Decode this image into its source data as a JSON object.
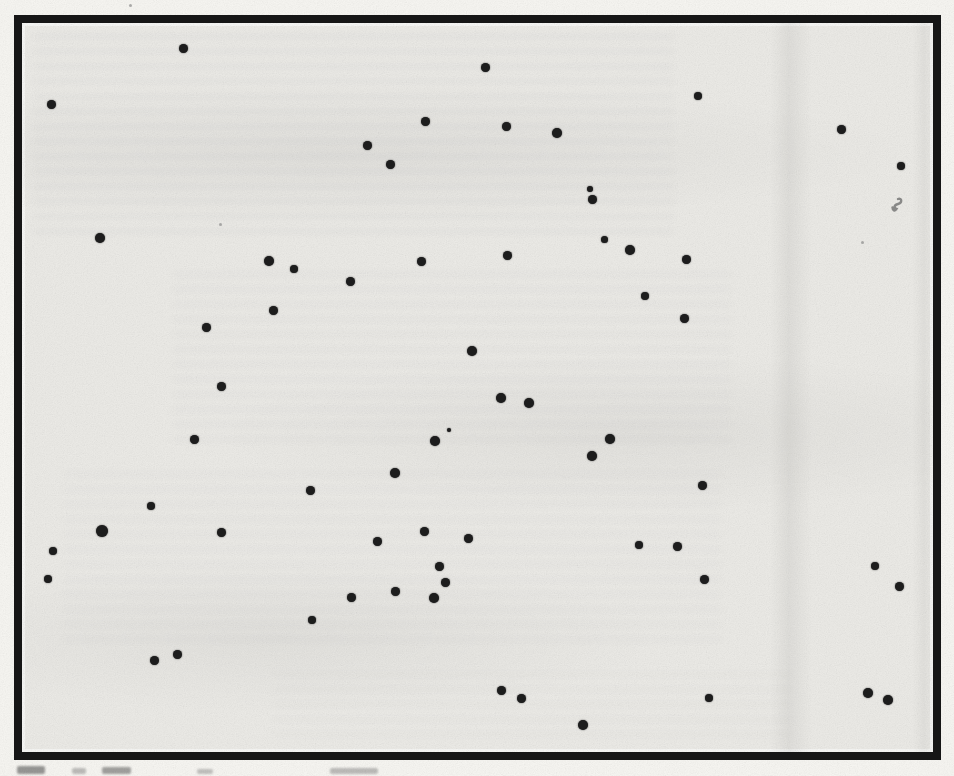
{
  "figure": {
    "colors": {
      "page": "#f7f6f2",
      "field": "#ecebe7",
      "frame": "#161616",
      "dot": "#1d1d1d",
      "speck": "#9a9a98",
      "smudge": "#6b6b6b"
    },
    "frame": {
      "left": 14,
      "top": 15,
      "width": 927,
      "height": 745,
      "border_px": 8
    },
    "dot_count": 65,
    "dots": [
      [
        183,
        48,
        9
      ],
      [
        51,
        104,
        9
      ],
      [
        100,
        238,
        10
      ],
      [
        485,
        67,
        9
      ],
      [
        425,
        121,
        9
      ],
      [
        506,
        126,
        9
      ],
      [
        557,
        133,
        10
      ],
      [
        367,
        145,
        9
      ],
      [
        390,
        164,
        9
      ],
      [
        590,
        189,
        6
      ],
      [
        592,
        199,
        9
      ],
      [
        604,
        239,
        7
      ],
      [
        630,
        250,
        10
      ],
      [
        507,
        255,
        9
      ],
      [
        698,
        96,
        8
      ],
      [
        841,
        129,
        9
      ],
      [
        901,
        166,
        8
      ],
      [
        686,
        259,
        9
      ],
      [
        269,
        261,
        10
      ],
      [
        294,
        269,
        8
      ],
      [
        273,
        310,
        9
      ],
      [
        206,
        327,
        9
      ],
      [
        221,
        386,
        9
      ],
      [
        194,
        439,
        9
      ],
      [
        310,
        490,
        9
      ],
      [
        151,
        506,
        8
      ],
      [
        421,
        261,
        9
      ],
      [
        350,
        281,
        9
      ],
      [
        472,
        351,
        10
      ],
      [
        501,
        398,
        10
      ],
      [
        529,
        403,
        10
      ],
      [
        449,
        430,
        4
      ],
      [
        435,
        441,
        10
      ],
      [
        610,
        439,
        10
      ],
      [
        592,
        456,
        10
      ],
      [
        395,
        473,
        10
      ],
      [
        645,
        296,
        8
      ],
      [
        684,
        318,
        9
      ],
      [
        702,
        485,
        9
      ],
      [
        102,
        531,
        12
      ],
      [
        221,
        532,
        9
      ],
      [
        53,
        551,
        8
      ],
      [
        48,
        579,
        8
      ],
      [
        312,
        620,
        8
      ],
      [
        177,
        654,
        9
      ],
      [
        154,
        660,
        9
      ],
      [
        424,
        531,
        9
      ],
      [
        377,
        541,
        9
      ],
      [
        468,
        538,
        9
      ],
      [
        439,
        566,
        9
      ],
      [
        445,
        582,
        9
      ],
      [
        395,
        591,
        9
      ],
      [
        351,
        597,
        9
      ],
      [
        434,
        598,
        10
      ],
      [
        501,
        690,
        9
      ],
      [
        521,
        698,
        9
      ],
      [
        583,
        725,
        10
      ],
      [
        639,
        545,
        8
      ],
      [
        677,
        546,
        9
      ],
      [
        704,
        579,
        9
      ],
      [
        875,
        566,
        8
      ],
      [
        899,
        586,
        9
      ],
      [
        709,
        698,
        8
      ],
      [
        868,
        693,
        10
      ],
      [
        888,
        700,
        10
      ]
    ],
    "specks": [
      [
        130,
        5,
        3
      ],
      [
        220,
        224,
        3
      ],
      [
        862,
        242,
        3
      ]
    ],
    "ink_smudge": {
      "x": 887,
      "y": 196,
      "width": 18,
      "height": 24
    },
    "caption_fragments": [
      {
        "x": 17,
        "y": 766,
        "width": 28,
        "height": 8,
        "opacity": 0.5
      },
      {
        "x": 72,
        "y": 768,
        "width": 14,
        "height": 6,
        "opacity": 0.3
      },
      {
        "x": 102,
        "y": 767,
        "width": 29,
        "height": 7,
        "opacity": 0.45
      },
      {
        "x": 197,
        "y": 769,
        "width": 16,
        "height": 5,
        "opacity": 0.28
      },
      {
        "x": 330,
        "y": 768,
        "width": 48,
        "height": 6,
        "opacity": 0.3
      }
    ]
  }
}
